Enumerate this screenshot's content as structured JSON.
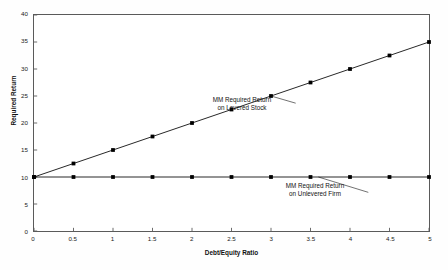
{
  "chart_data": {
    "type": "line",
    "title": "",
    "xlabel": "Debt/Equity Ratio",
    "ylabel": "Required Return",
    "xlim": [
      0,
      5
    ],
    "ylim": [
      0,
      40
    ],
    "grid": false,
    "legend_position": "none",
    "x": [
      0,
      0.5,
      1,
      1.5,
      2,
      2.5,
      3,
      3.5,
      4,
      4.5,
      5
    ],
    "xticks": [
      "0",
      "0.5",
      "1",
      "1.5",
      "2",
      "2.5",
      "3",
      "3.5",
      "4",
      "4.5",
      "5"
    ],
    "yticks": [
      "0",
      "5",
      "10",
      "15",
      "20",
      "25",
      "30",
      "35",
      "40"
    ],
    "ytick_values": [
      0,
      5,
      10,
      15,
      20,
      25,
      30,
      35,
      40
    ],
    "series": [
      {
        "name": "MM Required Return on Levered Stock",
        "values": [
          10,
          12.5,
          15,
          17.5,
          20,
          22.5,
          25,
          27.5,
          30,
          32.5,
          35
        ],
        "color": "#000000",
        "marker": "square"
      },
      {
        "name": "MM Required Return on Unlevered Firm",
        "values": [
          10,
          10,
          10,
          10,
          10,
          10,
          10,
          10,
          10,
          10,
          10
        ],
        "color": "#000000",
        "marker": "square"
      }
    ],
    "annotations": [
      {
        "id": "levered",
        "line1": "MM Required Return",
        "line2": "on Levered Stock",
        "target_x": 3,
        "target_y": 25
      },
      {
        "id": "unlevered",
        "line1": "MM Required Return",
        "line2": "on Unlevered Firm",
        "target_x": 3.5,
        "target_y": 10
      }
    ]
  },
  "axes": {
    "x_title": "Debt/Equity Ratio",
    "y_title": "Required Return"
  },
  "colors": {
    "line": "#000000",
    "frame": "#5a5a5a",
    "text": "#111111",
    "background": "#fefefe",
    "plot_background": "#ffffff"
  }
}
